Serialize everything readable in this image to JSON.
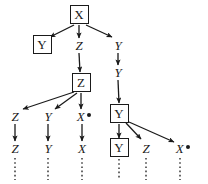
{
  "figure": {
    "width": 208,
    "height": 184,
    "ink_color": "#1a1a1a",
    "background_color": "#ffffff"
  },
  "nodes": [
    {
      "id": "n0",
      "label": "X",
      "boxed": true,
      "marked": false,
      "x": 79,
      "y": 14,
      "w": 19,
      "h": 19
    },
    {
      "id": "n1",
      "label": "Y",
      "boxed": true,
      "marked": false,
      "x": 42,
      "y": 44,
      "w": 19,
      "h": 19
    },
    {
      "id": "n2",
      "label": "Z",
      "boxed": false,
      "marked": false,
      "x": 79,
      "y": 45,
      "w": 14,
      "h": 14
    },
    {
      "id": "n3",
      "label": "Y",
      "boxed": false,
      "marked": false,
      "x": 118,
      "y": 45,
      "w": 14,
      "h": 14
    },
    {
      "id": "n4",
      "label": "Z",
      "boxed": true,
      "marked": false,
      "x": 81,
      "y": 82,
      "w": 19,
      "h": 19
    },
    {
      "id": "n5",
      "label": "Y",
      "boxed": false,
      "marked": false,
      "x": 118,
      "y": 72,
      "w": 14,
      "h": 14
    },
    {
      "id": "n6",
      "label": "Y",
      "boxed": true,
      "marked": false,
      "x": 119,
      "y": 113,
      "w": 19,
      "h": 19
    },
    {
      "id": "n7",
      "label": "Z",
      "boxed": false,
      "marked": false,
      "x": 15,
      "y": 116,
      "w": 14,
      "h": 14
    },
    {
      "id": "n8",
      "label": "Y",
      "boxed": false,
      "marked": false,
      "x": 48,
      "y": 116,
      "w": 14,
      "h": 14
    },
    {
      "id": "n9",
      "label": "X",
      "boxed": false,
      "marked": true,
      "x": 84,
      "y": 116,
      "w": 22,
      "h": 14
    },
    {
      "id": "n10",
      "label": "Z",
      "boxed": false,
      "marked": false,
      "x": 15,
      "y": 148,
      "w": 14,
      "h": 14
    },
    {
      "id": "n11",
      "label": "Y",
      "boxed": false,
      "marked": false,
      "x": 48,
      "y": 148,
      "w": 14,
      "h": 14
    },
    {
      "id": "n12",
      "label": "X",
      "boxed": false,
      "marked": false,
      "x": 82,
      "y": 148,
      "w": 14,
      "h": 14
    },
    {
      "id": "n13",
      "label": "Y",
      "boxed": true,
      "marked": false,
      "x": 119,
      "y": 147,
      "w": 19,
      "h": 19
    },
    {
      "id": "n14",
      "label": "Z",
      "boxed": false,
      "marked": false,
      "x": 146,
      "y": 148,
      "w": 14,
      "h": 14
    },
    {
      "id": "n15",
      "label": "X",
      "boxed": false,
      "marked": true,
      "x": 183,
      "y": 148,
      "w": 22,
      "h": 14
    }
  ],
  "edges": [
    {
      "from": "n0",
      "to": "n1",
      "x1": 74,
      "y1": 25,
      "x2": 50,
      "y2": 37
    },
    {
      "from": "n0",
      "to": "n2",
      "x1": 79,
      "y1": 25,
      "x2": 79,
      "y2": 38
    },
    {
      "from": "n0",
      "to": "n3",
      "x1": 86,
      "y1": 25,
      "x2": 112,
      "y2": 37
    },
    {
      "from": "n2",
      "to": "n4",
      "x1": 79,
      "y1": 53,
      "x2": 80,
      "y2": 72
    },
    {
      "from": "n3",
      "to": "n5",
      "x1": 118,
      "y1": 53,
      "x2": 118,
      "y2": 65
    },
    {
      "from": "n5",
      "to": "n6",
      "x1": 118,
      "y1": 80,
      "x2": 119,
      "y2": 103
    },
    {
      "from": "n4",
      "to": "n7",
      "x1": 74,
      "y1": 92,
      "x2": 23,
      "y2": 109
    },
    {
      "from": "n4",
      "to": "n8",
      "x1": 77,
      "y1": 93,
      "x2": 55,
      "y2": 109
    },
    {
      "from": "n4",
      "to": "n9",
      "x1": 81,
      "y1": 93,
      "x2": 81,
      "y2": 109
    },
    {
      "from": "n7",
      "to": "n10",
      "x1": 15,
      "y1": 124,
      "x2": 15,
      "y2": 141
    },
    {
      "from": "n8",
      "to": "n11",
      "x1": 48,
      "y1": 124,
      "x2": 48,
      "y2": 141
    },
    {
      "from": "n9",
      "to": "n12",
      "x1": 82,
      "y1": 124,
      "x2": 82,
      "y2": 141
    },
    {
      "from": "n6",
      "to": "n13",
      "x1": 119,
      "y1": 124,
      "x2": 119,
      "y2": 138
    },
    {
      "from": "n6",
      "to": "n14",
      "x1": 126,
      "y1": 123,
      "x2": 141,
      "y2": 139
    },
    {
      "from": "n6",
      "to": "n15",
      "x1": 129,
      "y1": 122,
      "x2": 174,
      "y2": 142
    }
  ],
  "continuations": [
    {
      "under": "n10",
      "x": 15,
      "y1": 158,
      "y2": 180
    },
    {
      "under": "n11",
      "x": 48,
      "y1": 158,
      "y2": 180
    },
    {
      "under": "n12",
      "x": 82,
      "y1": 158,
      "y2": 180
    },
    {
      "under": "n13",
      "x": 119,
      "y1": 159,
      "y2": 180
    },
    {
      "under": "n14",
      "x": 146,
      "y1": 158,
      "y2": 180
    },
    {
      "under": "n15",
      "x": 180,
      "y1": 158,
      "y2": 180
    }
  ]
}
